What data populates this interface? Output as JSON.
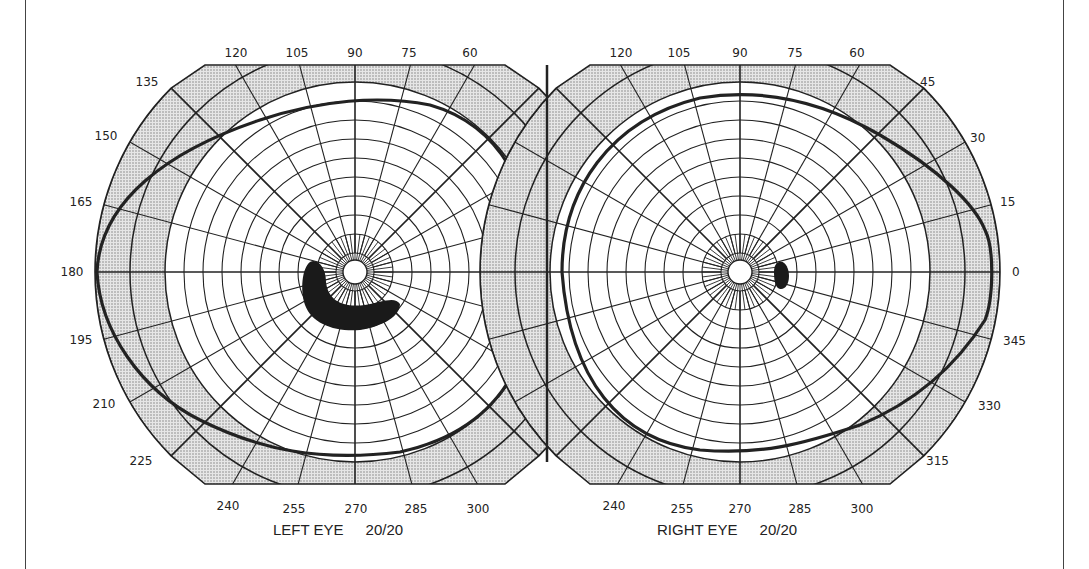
{
  "figure": {
    "type": "visual-field-perimetry-chart",
    "left_eye": {
      "caption": "LEFT EYE",
      "acuity": "20/20",
      "center": [
        355,
        272
      ],
      "meridian_labels": [
        "0",
        "15",
        "30",
        "45",
        "60",
        "75",
        "90",
        "105",
        "120",
        "135",
        "150",
        "165",
        "180",
        "195",
        "210",
        "225",
        "240",
        "255",
        "270",
        "285",
        "300",
        "315",
        "330",
        "345"
      ],
      "visible_labels": [
        "120",
        "105",
        "90",
        "75",
        "60",
        "135",
        "150",
        "165",
        "180",
        "195",
        "210",
        "225",
        "240",
        "255",
        "270",
        "285",
        "300"
      ],
      "scotoma": "large arcuate scotoma inferotemporal to fixation"
    },
    "right_eye": {
      "caption": "RIGHT EYE",
      "acuity": "20/20",
      "center": [
        740,
        272
      ],
      "visible_labels": [
        "120",
        "105",
        "90",
        "75",
        "60",
        "45",
        "30",
        "15",
        "0",
        "345",
        "330",
        "315",
        "240",
        "255",
        "270",
        "285",
        "300"
      ],
      "scotoma": "small oval scotoma temporal to fixation (blind spot)"
    },
    "colors": {
      "line": "#222222",
      "shade": "#cfcfcf",
      "background": "#ffffff"
    }
  }
}
